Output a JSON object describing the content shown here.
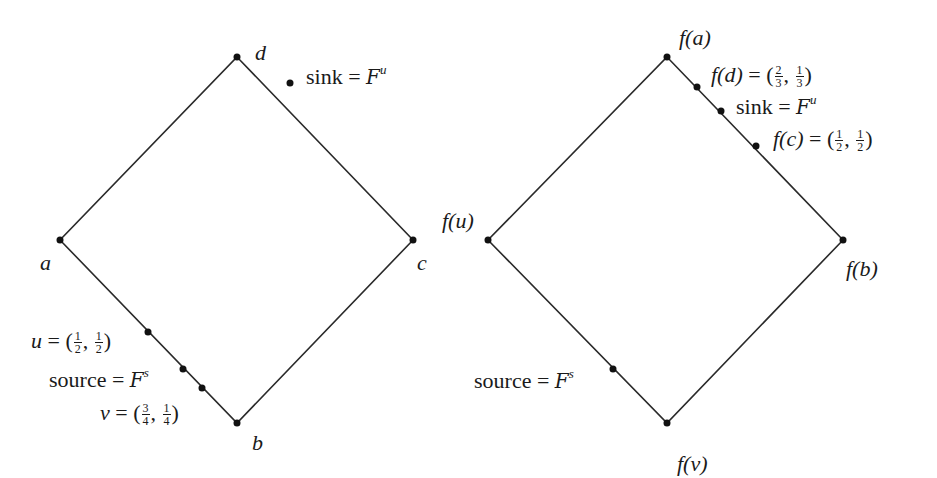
{
  "diagram": {
    "left": {
      "vertices": {
        "top": {
          "label": "d",
          "x": 237,
          "y": 57
        },
        "left": {
          "label": "a",
          "x": 60,
          "y": 240
        },
        "right": {
          "label": "c",
          "x": 413,
          "y": 240
        },
        "bottom": {
          "label": "b",
          "x": 237,
          "y": 423
        }
      },
      "edge_points": [
        {
          "name": "sink",
          "x": 290,
          "y": 83
        },
        {
          "name": "u",
          "x": 148,
          "y": 332
        },
        {
          "name": "source",
          "x": 183,
          "y": 369
        },
        {
          "name": "v",
          "x": 202,
          "y": 388
        }
      ],
      "labels": {
        "sink_text": "sink",
        "sink_eq": "=",
        "sink_script": "F",
        "sink_sup": "u",
        "u_var": "u",
        "u_eq": "= (",
        "u_n1": "1",
        "u_d1": "2",
        "u_sep": ",",
        "u_n2": "1",
        "u_d2": "2",
        "u_close": ")",
        "source_text": "source",
        "source_eq": "=",
        "source_script": "F",
        "source_sup": "s",
        "v_var": "v",
        "v_eq": "= (",
        "v_n1": "3",
        "v_d1": "4",
        "v_sep": ",",
        "v_n2": "1",
        "v_d2": "4",
        "v_close": ")"
      }
    },
    "right": {
      "vertices": {
        "top": {
          "label": "f(a)",
          "x": 667,
          "y": 57
        },
        "left": {
          "label": "f(u)",
          "x": 488,
          "y": 240
        },
        "right": {
          "label": "f(b)",
          "x": 843,
          "y": 240
        },
        "bottom": {
          "label": "f(v)",
          "x": 667,
          "y": 423
        }
      },
      "edge_points": [
        {
          "name": "f(d)",
          "x": 697,
          "y": 87
        },
        {
          "name": "sink",
          "x": 721,
          "y": 111
        },
        {
          "name": "f(c)",
          "x": 756,
          "y": 146
        },
        {
          "name": "source",
          "x": 613,
          "y": 369
        }
      ],
      "labels": {
        "fd_var": "f(d)",
        "fd_eq": "= (",
        "fd_n1": "2",
        "fd_d1": "3",
        "fd_sep": ",",
        "fd_n2": "1",
        "fd_d2": "3",
        "fd_close": ")",
        "sink_text": "sink",
        "sink_eq": "=",
        "sink_script": "F",
        "sink_sup": "u",
        "fc_var": "f(c)",
        "fc_eq": "= (",
        "fc_n1": "1",
        "fc_d1": "2",
        "fc_sep": ",",
        "fc_n2": "1",
        "fc_d2": "2",
        "fc_close": ")",
        "source_text": "source",
        "source_eq": "=",
        "source_script": "F",
        "source_sup": "s"
      }
    },
    "colors": {
      "line": "#2a2a2a",
      "dot": "#111111",
      "background": "#ffffff"
    }
  }
}
